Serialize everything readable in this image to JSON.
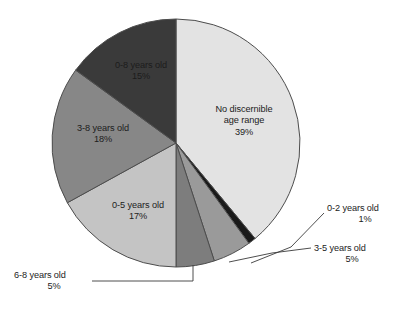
{
  "chart_data": {
    "type": "pie",
    "title": "",
    "subtitle": "",
    "xlabel": "",
    "ylabel": "",
    "legend_position": "none",
    "grid": false,
    "start_angle_deg": 0,
    "direction": "clockwise",
    "categories": [
      "No discernible age range",
      "0-2 years old",
      "3-5 years old",
      "6-8 years old",
      "0-5 years old",
      "3-8 years old",
      "0-8 years old"
    ],
    "values": [
      39,
      1,
      5,
      5,
      17,
      18,
      15
    ],
    "units": "percent",
    "slices": [
      {
        "label": "No discernible age range",
        "label_line1": "No discernible",
        "label_line2": "age range",
        "value": 39,
        "value_text": "39%",
        "color": "#e3e3e3",
        "label_placement": "inside"
      },
      {
        "label": "0-2 years old",
        "value": 1,
        "value_text": "1%",
        "color": "#1a1a1a",
        "label_placement": "callout"
      },
      {
        "label": "3-5 years old",
        "value": 5,
        "value_text": "5%",
        "color": "#9a9a9a",
        "label_placement": "callout"
      },
      {
        "label": "6-8 years old",
        "value": 5,
        "value_text": "5%",
        "color": "#7d7d7d",
        "label_placement": "callout"
      },
      {
        "label": "0-5 years old",
        "value": 17,
        "value_text": "17%",
        "color": "#c4c4c4",
        "label_placement": "inside"
      },
      {
        "label": "3-8 years old",
        "value": 18,
        "value_text": "18%",
        "color": "#878787",
        "label_placement": "inside"
      },
      {
        "label": "0-8 years old",
        "value": 15,
        "value_text": "15%",
        "color": "#3a3a3a",
        "label_placement": "inside"
      }
    ],
    "colors": {
      "no_discernible": "#e3e3e3",
      "age_0_2": "#1a1a1a",
      "age_3_5": "#9a9a9a",
      "age_6_8": "#7d7d7d",
      "age_0_5": "#c4c4c4",
      "age_3_8": "#878787",
      "age_0_8": "#3a3a3a",
      "outline": "#4d4d4d",
      "leader_line": "#3a3a3a",
      "text": "#1c1c1c",
      "background": "#ffffff"
    }
  },
  "labels": {
    "no_discernible": {
      "line1": "No discernible",
      "line2": "age range",
      "pct": "39%"
    },
    "age_0_8": {
      "name": "0-8 years old",
      "pct": "15%"
    },
    "age_3_8": {
      "name": "3-8 years old",
      "pct": "18%"
    },
    "age_0_5": {
      "name": "0-5 years old",
      "pct": "17%"
    },
    "age_0_2": {
      "name": "0-2 years old",
      "pct": "1%"
    },
    "age_3_5": {
      "name": "3-5 years old",
      "pct": "5%"
    },
    "age_6_8": {
      "name": "6-8 years old",
      "pct": "5%"
    }
  }
}
